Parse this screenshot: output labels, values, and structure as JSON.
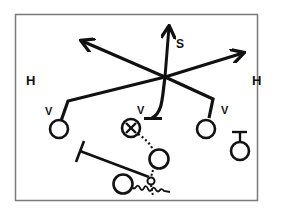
{
  "diagram": {
    "title": "",
    "colors": {
      "ink": "#111111",
      "frame": "#7a7a7a",
      "background": "#ffffff"
    },
    "labels": {
      "s": "S",
      "h_left": "H",
      "h_right": "H",
      "v_left": "V",
      "v_center": "V",
      "v_right": "V"
    },
    "symbols": [
      {
        "id": "player-left",
        "shape": "circle"
      },
      {
        "id": "player-center-x",
        "shape": "circle-with-x"
      },
      {
        "id": "player-right",
        "shape": "circle"
      },
      {
        "id": "player-far-right",
        "shape": "circle-with-t-bar"
      },
      {
        "id": "player-mid",
        "shape": "circle"
      },
      {
        "id": "player-bottom",
        "shape": "circle-with-squiggle"
      }
    ],
    "routes": [
      {
        "id": "route-s",
        "type": "arrow",
        "label": "S"
      },
      {
        "id": "route-h-left",
        "type": "arrow",
        "label": "H"
      },
      {
        "id": "route-h-right",
        "type": "arrow",
        "label": "H"
      },
      {
        "id": "route-v-left",
        "type": "line",
        "label": "V"
      },
      {
        "id": "route-v-center",
        "type": "curve-with-t-block",
        "label": "V"
      },
      {
        "id": "route-v-right",
        "type": "line",
        "label": "V"
      },
      {
        "id": "route-dotted",
        "type": "dotted"
      },
      {
        "id": "route-block",
        "type": "t-block"
      },
      {
        "id": "route-motion",
        "type": "squiggle"
      }
    ]
  }
}
